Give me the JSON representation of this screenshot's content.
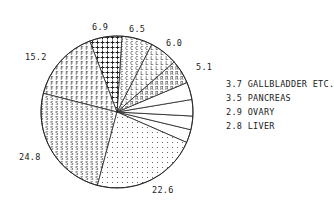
{
  "chart_data": {
    "type": "pie",
    "title": "",
    "start_angle_deg": -23.6,
    "direction": "counterclockwise",
    "center": [
      117,
      112
    ],
    "radius": 76,
    "slices": [
      {
        "label": "LIVER",
        "value": 2.8,
        "display": "2.8 LIVER",
        "pattern": "none",
        "legend_style": "right"
      },
      {
        "label": "OVARY",
        "value": 2.9,
        "display": "2.9 OVARY",
        "pattern": "none",
        "legend_style": "right"
      },
      {
        "label": "PANCREAS",
        "value": 3.5,
        "display": "3.5 PANCREAS",
        "pattern": "none",
        "legend_style": "right"
      },
      {
        "label": "GALLBLADDER ETC.",
        "value": 3.7,
        "display": "3.7 GALLBLADDER ETC.",
        "pattern": "none",
        "legend_style": "right"
      },
      {
        "label": "",
        "value": 5.1,
        "display": "5.1",
        "pattern": "R"
      },
      {
        "label": "",
        "value": 6.0,
        "display": "6.0",
        "pattern": "L"
      },
      {
        "label": "",
        "value": 6.5,
        "display": "6.5",
        "pattern": "C"
      },
      {
        "label": "",
        "value": 6.9,
        "display": "6.9",
        "pattern": "+"
      },
      {
        "label": "",
        "value": 15.2,
        "display": "15.2",
        "pattern": "F"
      },
      {
        "label": "",
        "value": 24.8,
        "display": "24.8",
        "pattern": "S"
      },
      {
        "label": "",
        "value": 22.6,
        "display": "22.6",
        "pattern": "dots"
      }
    ],
    "labels": [
      {
        "text": "2.8 LIVER",
        "x": 226,
        "y": 129
      },
      {
        "text": "2.9 OVARY",
        "x": 226,
        "y": 115
      },
      {
        "text": "3.5 PANCREAS",
        "x": 226,
        "y": 101
      },
      {
        "text": "3.7 GALLBLADDER ETC.",
        "x": 226,
        "y": 87
      },
      {
        "text": "5.1",
        "x": 196,
        "y": 70
      },
      {
        "text": "6.0",
        "x": 166,
        "y": 46
      },
      {
        "text": "6.5",
        "x": 129,
        "y": 32
      },
      {
        "text": "6.9",
        "x": 92,
        "y": 30
      },
      {
        "text": "15.2",
        "x": 25,
        "y": 60
      },
      {
        "text": "24.8",
        "x": 19,
        "y": 160
      },
      {
        "text": "22.6",
        "x": 152,
        "y": 193
      }
    ],
    "legend_position": "right",
    "grid": false
  }
}
